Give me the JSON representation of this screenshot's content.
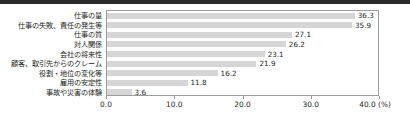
{
  "chart_data": {
    "type": "bar",
    "orientation": "horizontal",
    "title": "",
    "subtitle": "",
    "xlabel": "(%)",
    "ylabel": "",
    "xlim": [
      0.0,
      40.0
    ],
    "grid": false,
    "legend": null,
    "legend_position": "none",
    "bar_color": "#d6d6d6",
    "axis_color": "#9a9a9a",
    "text_color": "#231f20",
    "categories": [
      "仕事の量",
      "仕事の失敗、責任の発生等",
      "仕事の質",
      "対人関係",
      "会社の将来性",
      "顧客、取引先からのクレーム",
      "役割・地位の変化等",
      "雇用の安定性",
      "事故や災害の体験"
    ],
    "values": [
      36.3,
      35.9,
      27.1,
      26.2,
      23.1,
      21.9,
      16.2,
      11.8,
      3.6
    ],
    "value_labels": [
      "36.3",
      "35.9",
      "27.1",
      "26.2",
      "23.1",
      "21.9",
      "16.2",
      "11.8",
      "3.6"
    ],
    "xticks": [
      0.0,
      10.0,
      20.0,
      30.0,
      40.0
    ],
    "xtick_labels": [
      "0.0",
      "10.0",
      "20.0",
      "30.0",
      "40.0"
    ],
    "xtick_unit_suffix": "(%)"
  }
}
